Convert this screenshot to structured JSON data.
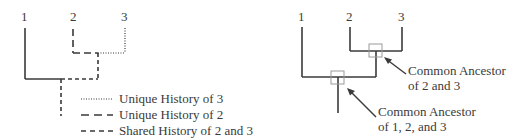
{
  "left_diagram": {
    "taxa": [
      "1",
      "2",
      "3"
    ],
    "legend": [
      {
        "style": "dotted",
        "label": "Unique History of 3"
      },
      {
        "style": "long-dash",
        "label": "Unique History of 2"
      },
      {
        "style": "short-dash",
        "label": "Shared History of 2 and 3"
      }
    ]
  },
  "right_diagram": {
    "taxa": [
      "1",
      "2",
      "3"
    ],
    "annotations": [
      {
        "line1": "Common Ancestor",
        "line2": "of 2 and 3"
      },
      {
        "line1": "Common Ancestor",
        "line2": "of 1, 2, and 3"
      }
    ]
  },
  "colors": {
    "line": "#3a3a3a",
    "box": "#9a9a9a",
    "background": "#ffffff"
  }
}
